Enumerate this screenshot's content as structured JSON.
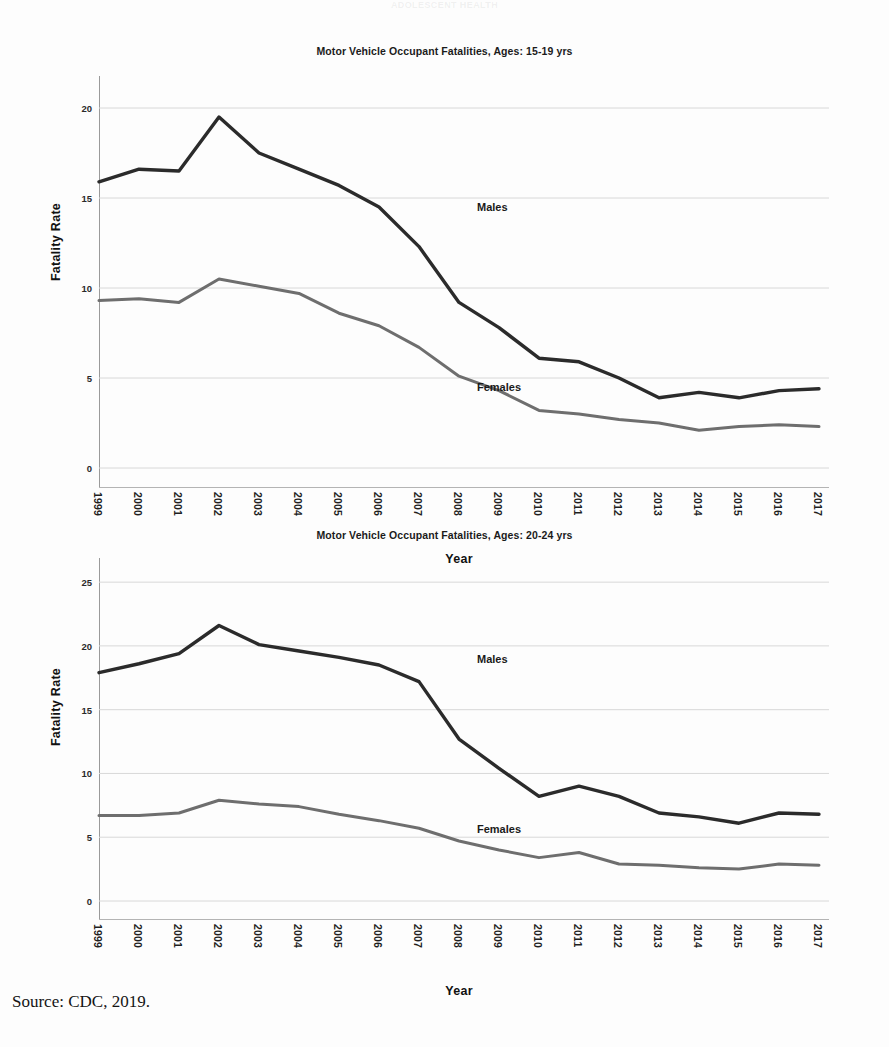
{
  "document": {
    "ghost_header": "ADOLESCENT HEALTH",
    "source_note": "Source: CDC, 2019."
  },
  "colors": {
    "males_line": "#2b2b2b",
    "females_line": "#6e6e6e",
    "gridline": "#d8d8d8",
    "axis": "#9a9a9a",
    "background": "#fdfdfd"
  },
  "chart_data": [
    {
      "type": "line",
      "title": "Motor Vehicle Occupant Fatalities, Ages: 15-19 yrs",
      "xlabel": "Year",
      "ylabel": "Fatality Rate",
      "ylim": [
        0,
        21.5
      ],
      "yticks": [
        0,
        5,
        10,
        15,
        20
      ],
      "ytick_labels": [
        "0",
        "5",
        "10",
        "15",
        "20"
      ],
      "grid": true,
      "legend_position": "inline-annotation",
      "categories": [
        1999,
        2000,
        2001,
        2002,
        2003,
        2004,
        2005,
        2006,
        2007,
        2008,
        2009,
        2010,
        2011,
        2012,
        2013,
        2014,
        2015,
        2016,
        2017
      ],
      "xtick_labels": [
        "1999",
        "2000",
        "2001",
        "2002",
        "2003",
        "2004",
        "2005",
        "2006",
        "2007",
        "2008",
        "2009",
        "2010",
        "2011",
        "2012",
        "2013",
        "2014",
        "2015",
        "2016",
        "2017"
      ],
      "series": [
        {
          "name": "Males",
          "color": "#2b2b2b",
          "annotation": "Males",
          "values": [
            15.9,
            16.6,
            16.5,
            19.5,
            17.5,
            16.6,
            15.7,
            14.5,
            12.3,
            9.2,
            7.8,
            6.1,
            5.9,
            5.0,
            3.9,
            4.2,
            3.9,
            4.3,
            4.4
          ]
        },
        {
          "name": "Females",
          "color": "#6e6e6e",
          "annotation": "Females",
          "values": [
            9.3,
            9.4,
            9.2,
            10.5,
            10.1,
            9.7,
            8.6,
            7.9,
            6.7,
            5.1,
            4.3,
            3.2,
            3.0,
            2.7,
            2.5,
            2.1,
            2.3,
            2.4,
            2.3
          ]
        }
      ]
    },
    {
      "type": "line",
      "title": "Motor Vehicle Occupant Fatalities, Ages: 20-24 yrs",
      "xlabel": "Year",
      "ylabel": "Fatality Rate",
      "ylim": [
        0,
        26.5
      ],
      "yticks": [
        0,
        5,
        10,
        15,
        20,
        25
      ],
      "ytick_labels": [
        "0",
        "5",
        "10",
        "15",
        "20",
        "25"
      ],
      "grid": true,
      "legend_position": "inline-annotation",
      "categories": [
        1999,
        2000,
        2001,
        2002,
        2003,
        2004,
        2005,
        2006,
        2007,
        2008,
        2009,
        2010,
        2011,
        2012,
        2013,
        2014,
        2015,
        2016,
        2017
      ],
      "xtick_labels": [
        "1999",
        "2000",
        "2001",
        "2002",
        "2003",
        "2004",
        "2005",
        "2006",
        "2007",
        "2008",
        "2009",
        "2010",
        "2011",
        "2012",
        "2013",
        "2014",
        "2015",
        "2016",
        "2017"
      ],
      "series": [
        {
          "name": "Males",
          "color": "#2b2b2b",
          "annotation": "Males",
          "values": [
            17.9,
            18.6,
            19.4,
            21.6,
            20.1,
            19.6,
            19.1,
            18.5,
            17.2,
            12.7,
            10.4,
            8.2,
            9.0,
            8.2,
            6.9,
            6.6,
            6.1,
            6.9,
            6.8
          ]
        },
        {
          "name": "Females",
          "color": "#6e6e6e",
          "annotation": "Females",
          "values": [
            6.7,
            6.7,
            6.9,
            7.9,
            7.6,
            7.4,
            6.8,
            6.3,
            5.7,
            4.7,
            4.0,
            3.4,
            3.8,
            2.9,
            2.8,
            2.6,
            2.5,
            2.9,
            2.8
          ]
        }
      ]
    }
  ]
}
